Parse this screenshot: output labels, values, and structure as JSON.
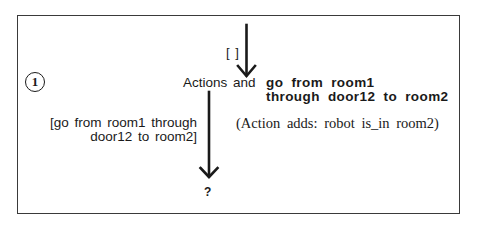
{
  "diagram": {
    "step_number": "1",
    "input_plan_label": "[ ]",
    "node_prefix": "Actions and",
    "action": {
      "line1": "go from room1",
      "line2": "through door12 to room2"
    },
    "effect": "(Action adds: robot is_in room2)",
    "output_plan": {
      "line1": "[go from room1 through",
      "line2": "door12 to room2]"
    },
    "result": "?",
    "colors": {
      "ink": "#1a1a1a",
      "frame": "#3a3a3a",
      "background": "#ffffff"
    }
  }
}
